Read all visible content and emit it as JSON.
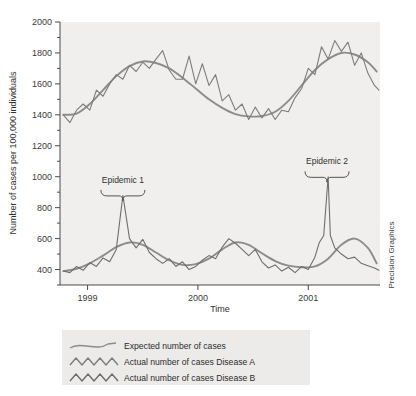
{
  "chart_data": {
    "type": "line",
    "title": "",
    "xlabel": "Time",
    "ylabel": "Number of cases per 100,000 individuals",
    "ylim": [
      300,
      2000
    ],
    "yticks": [
      400,
      600,
      800,
      1000,
      1200,
      1400,
      1600,
      1800,
      2000
    ],
    "ytick_labels": [
      "400",
      "600",
      "800",
      "1000",
      "1200",
      "1400",
      "1600",
      "1800",
      "2000"
    ],
    "minor_ticks": true,
    "xlim": [
      1998.75,
      2001.65
    ],
    "xticks": [
      1999,
      2000,
      2001
    ],
    "xtick_labels": [
      "1999",
      "2000",
      "2001"
    ],
    "grid": false,
    "legend_position": "below-plot",
    "annotations": [
      {
        "text": "Epidemic 1",
        "x": 1999.32,
        "y": 960,
        "brace": true
      },
      {
        "text": "Epidemic 2",
        "x": 2001.17,
        "y": 1080,
        "brace": true
      }
    ],
    "series": [
      {
        "name": "Expected number of cases Disease A",
        "style": "smooth",
        "color": "#8c8c8c",
        "x": [
          1998.78,
          1998.9,
          1999.02,
          1999.14,
          1999.26,
          1999.38,
          1999.5,
          1999.62,
          1999.74,
          1999.86,
          1999.98,
          2000.1,
          2000.22,
          2000.34,
          2000.46,
          2000.58,
          2000.7,
          2000.82,
          2000.94,
          2001.06,
          2001.18,
          2001.3,
          2001.42,
          2001.54,
          2001.62
        ],
        "values": [
          1400,
          1408,
          1470,
          1560,
          1650,
          1715,
          1745,
          1735,
          1700,
          1640,
          1570,
          1500,
          1445,
          1405,
          1390,
          1392,
          1420,
          1490,
          1590,
          1690,
          1760,
          1800,
          1790,
          1740,
          1680
        ]
      },
      {
        "name": "Actual number of cases Disease A",
        "style": "zigzag",
        "color": "#7d7d7d",
        "x": [
          1998.78,
          1998.84,
          1998.9,
          1998.96,
          1999.02,
          1999.08,
          1999.14,
          1999.2,
          1999.26,
          1999.32,
          1999.38,
          1999.44,
          1999.5,
          1999.56,
          1999.62,
          1999.68,
          1999.74,
          1999.8,
          1999.86,
          1999.92,
          1999.98,
          2000.04,
          2000.1,
          2000.16,
          2000.22,
          2000.28,
          2000.34,
          2000.4,
          2000.46,
          2000.52,
          2000.58,
          2000.64,
          2000.7,
          2000.76,
          2000.82,
          2000.88,
          2000.94,
          2001.0,
          2001.06,
          2001.12,
          2001.18,
          2001.24,
          2001.3,
          2001.36,
          2001.42,
          2001.48,
          2001.54,
          2001.6,
          2001.64
        ],
        "values": [
          1400,
          1350,
          1430,
          1470,
          1430,
          1560,
          1520,
          1600,
          1660,
          1630,
          1720,
          1680,
          1740,
          1700,
          1760,
          1815,
          1690,
          1630,
          1630,
          1780,
          1600,
          1730,
          1590,
          1660,
          1490,
          1530,
          1430,
          1470,
          1370,
          1450,
          1380,
          1440,
          1370,
          1430,
          1420,
          1510,
          1570,
          1700,
          1660,
          1840,
          1760,
          1880,
          1810,
          1870,
          1720,
          1800,
          1670,
          1590,
          1560
        ]
      },
      {
        "name": "Expected number of cases Disease B",
        "style": "smooth",
        "color": "#8c8c8c",
        "x": [
          1998.78,
          1998.9,
          1999.02,
          1999.14,
          1999.26,
          1999.38,
          1999.5,
          1999.62,
          1999.74,
          1999.86,
          1999.98,
          2000.1,
          2000.22,
          2000.34,
          2000.46,
          2000.58,
          2000.7,
          2000.82,
          2000.94,
          2001.06,
          2001.18,
          2001.3,
          2001.42,
          2001.54,
          2001.62
        ],
        "values": [
          390,
          405,
          440,
          490,
          545,
          575,
          560,
          510,
          460,
          430,
          435,
          470,
          530,
          575,
          560,
          505,
          455,
          425,
          415,
          420,
          470,
          560,
          600,
          540,
          440
        ]
      },
      {
        "name": "Actual number of cases Disease B",
        "style": "zigzag",
        "color": "#6e6e6e",
        "x": [
          1998.78,
          1998.84,
          1998.9,
          1998.96,
          1999.02,
          1999.08,
          1999.14,
          1999.2,
          1999.26,
          1999.32,
          1999.38,
          1999.44,
          1999.5,
          1999.56,
          1999.62,
          1999.68,
          1999.74,
          1999.8,
          1999.86,
          1999.92,
          1999.98,
          2000.04,
          2000.1,
          2000.16,
          2000.22,
          2000.28,
          2000.34,
          2000.4,
          2000.46,
          2000.52,
          2000.58,
          2000.64,
          2000.7,
          2000.76,
          2000.82,
          2000.88,
          2000.94,
          2001.0,
          2001.06,
          2001.1,
          2001.14,
          2001.18,
          2001.2,
          2001.24,
          2001.3,
          2001.36,
          2001.42,
          2001.48,
          2001.54,
          2001.6,
          2001.64
        ],
        "values": [
          390,
          380,
          420,
          395,
          445,
          420,
          475,
          450,
          530,
          880,
          600,
          540,
          595,
          510,
          470,
          440,
          470,
          420,
          450,
          400,
          420,
          460,
          490,
          470,
          545,
          600,
          570,
          530,
          490,
          530,
          450,
          410,
          430,
          390,
          415,
          380,
          420,
          400,
          480,
          575,
          620,
          1000,
          620,
          540,
          500,
          470,
          480,
          440,
          425,
          410,
          395
        ]
      }
    ],
    "epidemic_values": {
      "epidemic_1_peak": 880,
      "epidemic_2_peak": 1000
    }
  },
  "legend": {
    "items": [
      {
        "label": "Expected number of cases",
        "swatch": "smooth-line-swatch",
        "color": "#8c8c8c"
      },
      {
        "label": "Actual number of cases Disease A",
        "swatch": "zigzag-line-swatch",
        "color": "#7d7d7d"
      },
      {
        "label": "Actual number of cases Disease B",
        "swatch": "zigzag-line-swatch",
        "color": "#6e6e6e"
      }
    ]
  },
  "credit": {
    "text": "Precision Graphics"
  }
}
